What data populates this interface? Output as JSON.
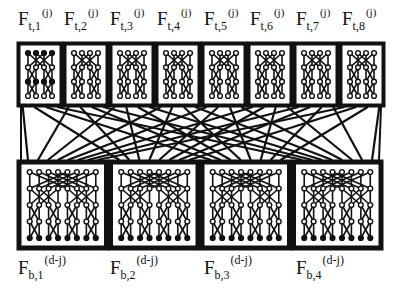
{
  "diagram": {
    "top_blocks": [
      {
        "label_main": "F",
        "label_sub": "t,1",
        "label_sup": "(j)"
      },
      {
        "label_main": "F",
        "label_sub": "t,2",
        "label_sup": "(j)"
      },
      {
        "label_main": "F",
        "label_sub": "t,3",
        "label_sup": "(j)"
      },
      {
        "label_main": "F",
        "label_sub": "t,4",
        "label_sup": "(j)"
      },
      {
        "label_main": "F",
        "label_sub": "t,5",
        "label_sup": "(j)"
      },
      {
        "label_main": "F",
        "label_sub": "t,6",
        "label_sup": "(j)"
      },
      {
        "label_main": "F",
        "label_sub": "t,7",
        "label_sup": "(j)"
      },
      {
        "label_main": "F",
        "label_sub": "t,8",
        "label_sup": "(j)"
      }
    ],
    "bottom_blocks": [
      {
        "label_main": "F",
        "label_sub": "b,1",
        "label_sup": "(d-j)"
      },
      {
        "label_main": "F",
        "label_sub": "b,2",
        "label_sup": "(d-j)"
      },
      {
        "label_main": "F",
        "label_sub": "b,3",
        "label_sup": "(d-j)"
      },
      {
        "label_main": "F",
        "label_sub": "b,4",
        "label_sup": "(d-j)"
      }
    ],
    "colors": {
      "ink": "#111111",
      "paper": "#ffffff"
    }
  }
}
